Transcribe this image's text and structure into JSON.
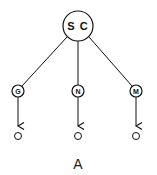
{
  "diagram": {
    "root": {
      "label": "S C"
    },
    "children": [
      {
        "label": "G"
      },
      {
        "label": "N"
      },
      {
        "label": "M"
      }
    ],
    "caption": "A",
    "colors": {
      "stroke": "#111111",
      "background": "#ffffff"
    }
  }
}
